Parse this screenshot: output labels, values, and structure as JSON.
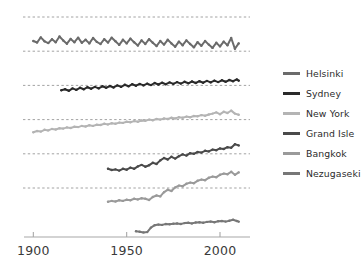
{
  "chart_data": {
    "type": "line",
    "title": "",
    "xlabel": "",
    "ylabel": "",
    "xlim": [
      1895,
      2015
    ],
    "ylim": [
      0,
      6
    ],
    "grid": true,
    "legend_position": "right",
    "xticks": [
      1900,
      1950,
      2000
    ],
    "xtick_labels": [
      "1900",
      "1950",
      "2000"
    ],
    "gridlines": [
      {
        "label": "",
        "y_offset": 5
      },
      {
        "label": "",
        "y_offset": 4
      },
      {
        "label": "",
        "y_offset": 3
      },
      {
        "label": "",
        "y_offset": 2
      },
      {
        "label": "",
        "y_offset": 1
      },
      {
        "label": "",
        "y_offset": 0
      }
    ],
    "series": [
      {
        "name": "Helsinki",
        "color": "#6b6b6b",
        "baseline_index": 4,
        "x_start": 1900,
        "x_end": 2010,
        "x": [
          1900,
          1902,
          1904,
          1906,
          1908,
          1910,
          1912,
          1914,
          1916,
          1918,
          1920,
          1922,
          1924,
          1926,
          1928,
          1930,
          1932,
          1934,
          1936,
          1938,
          1940,
          1942,
          1944,
          1946,
          1948,
          1950,
          1952,
          1954,
          1956,
          1958,
          1960,
          1962,
          1964,
          1966,
          1968,
          1970,
          1972,
          1974,
          1976,
          1978,
          1980,
          1982,
          1984,
          1986,
          1988,
          1990,
          1992,
          1994,
          1996,
          1998,
          2000,
          2002,
          2004,
          2006,
          2008,
          2010
        ],
        "values": [
          0.34,
          0.29,
          0.46,
          0.33,
          0.27,
          0.4,
          0.3,
          0.49,
          0.36,
          0.25,
          0.41,
          0.3,
          0.45,
          0.28,
          0.38,
          0.26,
          0.44,
          0.31,
          0.24,
          0.4,
          0.29,
          0.45,
          0.33,
          0.21,
          0.38,
          0.26,
          0.42,
          0.3,
          0.19,
          0.36,
          0.24,
          0.4,
          0.28,
          0.17,
          0.34,
          0.22,
          0.38,
          0.26,
          0.15,
          0.32,
          0.2,
          0.36,
          0.24,
          0.13,
          0.3,
          0.18,
          0.34,
          0.22,
          0.11,
          0.28,
          0.16,
          0.32,
          0.2,
          0.44,
          0.08,
          0.26
        ]
      },
      {
        "name": "Sydney",
        "color": "#2a2a2a",
        "baseline_index": 3,
        "x_start": 1915,
        "x_end": 2010,
        "x": [
          1915,
          1917,
          1919,
          1921,
          1923,
          1925,
          1927,
          1929,
          1931,
          1933,
          1935,
          1937,
          1939,
          1941,
          1943,
          1945,
          1947,
          1949,
          1951,
          1953,
          1955,
          1957,
          1959,
          1961,
          1963,
          1965,
          1967,
          1969,
          1971,
          1973,
          1975,
          1977,
          1979,
          1981,
          1983,
          1985,
          1987,
          1989,
          1991,
          1993,
          1995,
          1997,
          1999,
          2001,
          2003,
          2005,
          2007,
          2009,
          2010
        ],
        "values": [
          -0.16,
          -0.13,
          -0.18,
          -0.1,
          -0.15,
          -0.08,
          -0.13,
          -0.06,
          -0.11,
          -0.05,
          -0.1,
          -0.03,
          -0.08,
          -0.02,
          -0.07,
          0.0,
          -0.05,
          0.02,
          -0.03,
          0.04,
          -0.01,
          0.05,
          0.0,
          0.06,
          0.01,
          0.08,
          0.03,
          0.09,
          0.04,
          0.1,
          0.05,
          0.11,
          0.06,
          0.12,
          0.07,
          0.13,
          0.08,
          0.14,
          0.09,
          0.15,
          0.1,
          0.16,
          0.11,
          0.17,
          0.12,
          0.18,
          0.14,
          0.2,
          0.16
        ]
      },
      {
        "name": "New York",
        "color": "#b4b4b4",
        "baseline_index": 2,
        "x_start": 1900,
        "x_end": 2010,
        "x": [
          1900,
          1902,
          1904,
          1906,
          1908,
          1910,
          1912,
          1914,
          1916,
          1918,
          1920,
          1922,
          1924,
          1926,
          1928,
          1930,
          1932,
          1934,
          1936,
          1938,
          1940,
          1942,
          1944,
          1946,
          1948,
          1950,
          1952,
          1954,
          1956,
          1958,
          1960,
          1962,
          1964,
          1966,
          1968,
          1970,
          1972,
          1974,
          1976,
          1978,
          1980,
          1982,
          1984,
          1986,
          1988,
          1990,
          1992,
          1994,
          1996,
          1998,
          2000,
          2002,
          2004,
          2006,
          2008,
          2010
        ],
        "values": [
          -0.42,
          -0.38,
          -0.4,
          -0.34,
          -0.36,
          -0.31,
          -0.33,
          -0.29,
          -0.3,
          -0.26,
          -0.28,
          -0.24,
          -0.25,
          -0.21,
          -0.23,
          -0.19,
          -0.21,
          -0.17,
          -0.18,
          -0.14,
          -0.16,
          -0.12,
          -0.14,
          -0.1,
          -0.11,
          -0.07,
          -0.09,
          -0.05,
          -0.07,
          -0.03,
          -0.04,
          0.0,
          -0.02,
          0.02,
          0.0,
          0.04,
          0.02,
          0.06,
          0.04,
          0.08,
          0.06,
          0.1,
          0.08,
          0.12,
          0.11,
          0.15,
          0.13,
          0.17,
          0.2,
          0.24,
          0.18,
          0.26,
          0.22,
          0.3,
          0.2,
          0.16
        ]
      },
      {
        "name": "Grand Isle",
        "color": "#4a4a4a",
        "baseline_index": 1,
        "x_start": 1940,
        "x_end": 2010,
        "x": [
          1940,
          1942,
          1944,
          1946,
          1948,
          1950,
          1952,
          1954,
          1956,
          1958,
          1960,
          1962,
          1964,
          1966,
          1968,
          1970,
          1972,
          1974,
          1976,
          1978,
          1980,
          1982,
          1984,
          1986,
          1988,
          1990,
          1992,
          1994,
          1996,
          1998,
          2000,
          2002,
          2004,
          2006,
          2008,
          2010
        ],
        "values": [
          -0.5,
          -0.54,
          -0.52,
          -0.56,
          -0.5,
          -0.53,
          -0.46,
          -0.5,
          -0.42,
          -0.37,
          -0.43,
          -0.38,
          -0.3,
          -0.34,
          -0.22,
          -0.14,
          -0.19,
          -0.1,
          -0.16,
          -0.08,
          -0.02,
          -0.06,
          0.02,
          0.0,
          0.06,
          0.04,
          0.1,
          0.08,
          0.14,
          0.12,
          0.18,
          0.16,
          0.22,
          0.2,
          0.32,
          0.28
        ]
      },
      {
        "name": "Bangkok",
        "color": "#9a9a9a",
        "baseline_index": 0,
        "x_start": 1940,
        "x_end": 2010,
        "x": [
          1940,
          1942,
          1944,
          1946,
          1948,
          1950,
          1952,
          1954,
          1956,
          1958,
          1960,
          1962,
          1964,
          1966,
          1968,
          1970,
          1972,
          1974,
          1976,
          1978,
          1980,
          1982,
          1984,
          1986,
          1988,
          1990,
          1992,
          1994,
          1996,
          1998,
          2000,
          2002,
          2004,
          2006,
          2008,
          2010
        ],
        "values": [
          -0.46,
          -0.43,
          -0.45,
          -0.41,
          -0.43,
          -0.39,
          -0.41,
          -0.36,
          -0.38,
          -0.34,
          -0.36,
          -0.4,
          -0.3,
          -0.25,
          -0.28,
          -0.14,
          -0.06,
          -0.1,
          0.02,
          0.08,
          0.06,
          0.14,
          0.18,
          0.16,
          0.24,
          0.28,
          0.26,
          0.34,
          0.38,
          0.36,
          0.44,
          0.48,
          0.46,
          0.54,
          0.44,
          0.52
        ]
      },
      {
        "name": "Nezugaseki",
        "color": "#777777",
        "baseline_index": -1,
        "x_start": 1955,
        "x_end": 2010,
        "x": [
          1955,
          1957,
          1959,
          1961,
          1963,
          1965,
          1967,
          1969,
          1971,
          1973,
          1975,
          1977,
          1979,
          1981,
          1983,
          1985,
          1987,
          1989,
          1991,
          1993,
          1995,
          1997,
          1999,
          2001,
          2003,
          2005,
          2007,
          2009,
          2010
        ],
        "values": [
          -0.3,
          -0.32,
          -0.34,
          -0.33,
          -0.18,
          -0.1,
          -0.08,
          -0.09,
          -0.06,
          -0.07,
          -0.05,
          -0.04,
          -0.06,
          -0.03,
          -0.02,
          -0.04,
          -0.01,
          0.0,
          -0.02,
          0.01,
          0.02,
          0.0,
          0.03,
          0.04,
          0.02,
          0.05,
          0.08,
          0.04,
          0.02
        ]
      }
    ]
  },
  "legend": {
    "items": [
      {
        "label": "Helsinki",
        "color": "#6b6b6b"
      },
      {
        "label": "Sydney",
        "color": "#2a2a2a"
      },
      {
        "label": "New York",
        "color": "#b4b4b4"
      },
      {
        "label": "Grand Isle",
        "color": "#4a4a4a"
      },
      {
        "label": "Bangkok",
        "color": "#9a9a9a"
      },
      {
        "label": "Nezugaseki",
        "color": "#777777"
      }
    ]
  },
  "axis": {
    "line_color": "#a8a8a8",
    "grid_color": "#8a8a8a",
    "tick_labels": [
      "1900",
      "1950",
      "2000"
    ]
  }
}
